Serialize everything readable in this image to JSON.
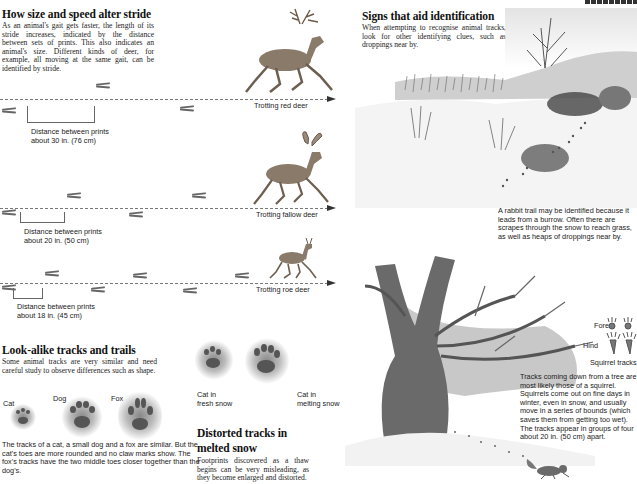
{
  "page_header": {
    "partial_title_visible": true
  },
  "stride_section": {
    "title": "How size and speed alter stride",
    "body": "As an animal's gait gets faster, the length of its stride increases, indicated by the distance between sets of prints. This also indicates an animal's size. Different kinds of deer, for example, all moving at the same gait, can be identified by stride.",
    "rows": [
      {
        "animal_label": "Trotting red deer",
        "distance_line1": "Distance between prints",
        "distance_line2": "about 30 in. (76 cm)"
      },
      {
        "animal_label": "Trotting fallow deer",
        "distance_line1": "Distance between prints",
        "distance_line2": "about 20 in. (50 cm)"
      },
      {
        "animal_label": "Trotting roe deer",
        "distance_line1": "Distance between prints",
        "distance_line2": "about 18 in. (45 cm)"
      }
    ]
  },
  "lookalike_section": {
    "title": "Look-alike tracks and trails",
    "body": "Some animal tracks are very similar and need careful study to observe differences such as shape.",
    "labels": [
      "Cat",
      "Dog",
      "Fox"
    ],
    "caption": "The tracks of a cat, a small dog and a fox are similar. But the cat's toes are more rounded and no claw marks show. The fox's tracks have the two middle toes closer together than the dog's."
  },
  "distorted_section": {
    "snow_labels": [
      {
        "line1": "Cat in",
        "line2": "fresh snow"
      },
      {
        "line1": "Cat in",
        "line2": "melting snow"
      }
    ],
    "title_line1": "Distorted tracks in",
    "title_line2": "melted snow",
    "body": "Footprints discovered as a thaw begins can be very misleading, as they become enlarged and distorted."
  },
  "signs_section": {
    "title": "Signs that aid identification",
    "body": "When attempting to recognise animal tracks, look for other identifying clues, such as droppings near by.",
    "rabbit_caption": "A rabbit trail may be identified because it leads from a burrow. Often there are scrapes through the snow to reach grass, as well as heaps of droppings near by."
  },
  "squirrel_section": {
    "fore_label": "Fore",
    "hind_label": "Hind",
    "tracks_label": "Squirrel tracks",
    "caption": "Tracks coming down from a tree are most likely those of a squirrel. Squirrels come out on fine days in winter, even in snow, and usually move in a series of bounds (which saves them from getting too wet). The tracks appear in groups of four about 20 in. (50 cm) apart."
  }
}
